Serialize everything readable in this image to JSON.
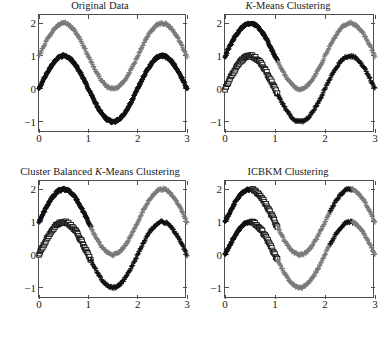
{
  "figure": {
    "width": 384,
    "height": 337,
    "background": "#ffffff",
    "layout": "2x2 grid of clustering scatter plots"
  },
  "colors": {
    "cluster_dark": "#111111",
    "cluster_gray": "#7a7a7a",
    "axis": "#4d4d4d",
    "text": "#1a1a1a"
  },
  "axes_common": {
    "xlim": [
      0,
      3
    ],
    "ylim": [
      -1.35,
      2.25
    ],
    "xticks": [
      0,
      1,
      2,
      3
    ],
    "xtick_labels": [
      "0",
      "1",
      "2",
      "3"
    ],
    "yticks": [
      -1,
      0,
      1,
      2
    ],
    "ytick_labels": [
      "−1",
      "0",
      "1",
      "2"
    ],
    "grid": false,
    "xlabel": "",
    "ylabel": ""
  },
  "curves": {
    "upper": {
      "description": "sine curve, amplitude 1, offset 1, period 2",
      "amplitude": 1.0,
      "offset": 1.0,
      "period": 2.0,
      "phase": 0.0,
      "n_points": 120,
      "noise": 0.035
    },
    "lower": {
      "description": "sine curve, amplitude 1, offset 0, period 2",
      "amplitude": 1.0,
      "offset": 0.0,
      "period": 2.0,
      "phase": 0.0,
      "n_points": 120,
      "noise": 0.035
    }
  },
  "panels": [
    {
      "id": "original-data",
      "title_parts": [
        {
          "text": "Original Data",
          "italic": false
        }
      ],
      "title_plain": "Original Data",
      "series": [
        {
          "name": "upper-curve",
          "curve": "upper",
          "marker": "plus",
          "color": "#7a7a7a",
          "x_from": 0.0,
          "x_to": 3.0
        },
        {
          "name": "lower-curve",
          "curve": "lower",
          "marker": "diamond",
          "color": "#111111",
          "x_from": 0.0,
          "x_to": 3.0
        }
      ]
    },
    {
      "id": "k-means-clustering",
      "title_parts": [
        {
          "text": "K",
          "italic": true
        },
        {
          "text": "-Means Clustering",
          "italic": false
        }
      ],
      "title_plain": "K-Means Clustering",
      "series": [
        {
          "name": "upper-left-dark-diamonds",
          "curve": "upper",
          "marker": "diamond",
          "color": "#111111",
          "x_from": 0.0,
          "x_to": 1.05
        },
        {
          "name": "upper-right-gray-plus",
          "curve": "upper",
          "marker": "plus",
          "color": "#7a7a7a",
          "x_from": 1.05,
          "x_to": 3.0
        },
        {
          "name": "lower-left-open-squares",
          "curve": "lower",
          "marker": "square",
          "color": "#111111",
          "x_from": 0.0,
          "x_to": 1.05
        },
        {
          "name": "lower-right-dark-plus",
          "curve": "lower",
          "marker": "plus",
          "color": "#111111",
          "x_from": 1.05,
          "x_to": 3.0
        }
      ]
    },
    {
      "id": "cluster-balanced-k-means-clustering",
      "title_parts": [
        {
          "text": "Cluster Balanced ",
          "italic": false
        },
        {
          "text": "K",
          "italic": true
        },
        {
          "text": "-Means Clustering",
          "italic": false
        }
      ],
      "title_plain": "Cluster Balanced K-Means Clustering",
      "series": [
        {
          "name": "upper-left-dark-diamonds",
          "curve": "upper",
          "marker": "diamond",
          "color": "#111111",
          "x_from": 0.0,
          "x_to": 1.05
        },
        {
          "name": "upper-right-gray-plus",
          "curve": "upper",
          "marker": "plus",
          "color": "#7a7a7a",
          "x_from": 1.05,
          "x_to": 3.0
        },
        {
          "name": "lower-left-open-squares",
          "curve": "lower",
          "marker": "square",
          "color": "#111111",
          "x_from": 0.0,
          "x_to": 1.05
        },
        {
          "name": "lower-right-dark-plus",
          "curve": "lower",
          "marker": "plus",
          "color": "#111111",
          "x_from": 1.05,
          "x_to": 3.0
        }
      ]
    },
    {
      "id": "icbkm-clustering",
      "title_parts": [
        {
          "text": "ICBKM Clustering",
          "italic": false
        }
      ],
      "title_plain": "ICBKM Clustering",
      "series": [
        {
          "name": "upper-left-dark-diamonds",
          "curve": "upper",
          "marker": "diamond",
          "color": "#111111",
          "x_from": 0.0,
          "x_to": 0.55
        },
        {
          "name": "upper-mid-open-squares",
          "curve": "upper",
          "marker": "square",
          "color": "#111111",
          "x_from": 0.55,
          "x_to": 1.05
        },
        {
          "name": "upper-right-gray-plus",
          "curve": "upper",
          "marker": "plus",
          "color": "#7a7a7a",
          "x_from": 1.05,
          "x_to": 2.1
        },
        {
          "name": "upper-far-right-dark-plus",
          "curve": "upper",
          "marker": "plus",
          "color": "#111111",
          "x_from": 2.1,
          "x_to": 2.55
        },
        {
          "name": "upper-tail-gray-plus",
          "curve": "upper",
          "marker": "plus",
          "color": "#7a7a7a",
          "x_from": 2.55,
          "x_to": 3.0
        },
        {
          "name": "lower-left-dark-diamonds",
          "curve": "lower",
          "marker": "diamond",
          "color": "#111111",
          "x_from": 0.0,
          "x_to": 0.55
        },
        {
          "name": "lower-mid-open-squares",
          "curve": "lower",
          "marker": "square",
          "color": "#111111",
          "x_from": 0.55,
          "x_to": 1.05
        },
        {
          "name": "lower-right-gray-plus",
          "curve": "lower",
          "marker": "plus",
          "color": "#7a7a7a",
          "x_from": 1.05,
          "x_to": 2.1
        },
        {
          "name": "lower-far-right-dark-plus",
          "curve": "lower",
          "marker": "plus",
          "color": "#111111",
          "x_from": 2.1,
          "x_to": 2.55
        },
        {
          "name": "lower-tail-gray-plus",
          "curve": "lower",
          "marker": "plus",
          "color": "#7a7a7a",
          "x_from": 2.55,
          "x_to": 3.0
        }
      ]
    }
  ],
  "chart_data": {
    "type": "scatter",
    "xlabel": "",
    "ylabel": "",
    "xlim": [
      0,
      3
    ],
    "ylim": [
      -1.35,
      2.25
    ],
    "xticks": [
      0,
      1,
      2,
      3
    ],
    "yticks": [
      -1,
      0,
      1,
      2
    ],
    "grid": false,
    "legend": "none",
    "subplot_titles": [
      "Original Data",
      "K-Means Clustering",
      "Cluster Balanced K-Means Clustering",
      "ICBKM Clustering"
    ],
    "x": [
      0.0,
      0.025,
      0.05,
      0.076,
      0.101,
      0.126,
      0.151,
      0.176,
      0.202,
      0.227,
      0.252,
      0.277,
      0.303,
      0.328,
      0.353,
      0.378,
      0.403,
      0.429,
      0.454,
      0.479,
      0.504,
      0.529,
      0.555,
      0.58,
      0.605,
      0.63,
      0.655,
      0.681,
      0.706,
      0.731,
      0.756,
      0.782,
      0.807,
      0.832,
      0.857,
      0.882,
      0.908,
      0.933,
      0.958,
      0.983,
      1.008,
      1.034,
      1.059,
      1.084,
      1.109,
      1.134,
      1.16,
      1.185,
      1.21,
      1.235,
      1.261,
      1.286,
      1.311,
      1.336,
      1.361,
      1.387,
      1.412,
      1.437,
      1.462,
      1.487,
      1.513,
      1.538,
      1.563,
      1.588,
      1.613,
      1.639,
      1.664,
      1.689,
      1.714,
      1.74,
      1.765,
      1.79,
      1.815,
      1.84,
      1.866,
      1.891,
      1.916,
      1.941,
      1.966,
      1.992,
      2.017,
      2.042,
      2.067,
      2.092,
      2.118,
      2.143,
      2.168,
      2.193,
      2.218,
      2.244,
      2.269,
      2.294,
      2.319,
      2.345,
      2.37,
      2.395,
      2.42,
      2.445,
      2.471,
      2.496,
      2.521,
      2.546,
      2.571,
      2.597,
      2.622,
      2.647,
      2.672,
      2.697,
      2.723,
      2.748,
      2.773,
      2.798,
      2.824,
      2.849,
      2.874,
      2.899,
      2.924,
      2.95,
      2.975,
      3.0
    ],
    "series": [
      {
        "name": "upper cluster (y = 1 + sin(pi x))",
        "formula": "y = 1 + sin(pi * x)",
        "values": [
          1.0,
          1.079,
          1.158,
          1.237,
          1.314,
          1.391,
          1.466,
          1.54,
          1.611,
          1.68,
          1.746,
          1.809,
          1.869,
          1.925,
          1.976,
          2.024,
          2.067,
          2.105,
          2.139,
          2.167,
          2.19,
          2.208,
          2.22,
          2.227,
          2.228,
          2.223,
          2.213,
          2.198,
          2.177,
          2.15,
          2.119,
          2.083,
          2.042,
          1.997,
          1.948,
          1.895,
          1.839,
          1.78,
          1.718,
          1.653,
          1.587,
          1.519,
          1.45,
          1.38,
          1.31,
          1.239,
          1.169,
          1.1,
          1.031,
          0.964,
          0.899,
          0.836,
          0.775,
          0.717,
          0.662,
          0.61,
          0.561,
          0.517,
          0.476,
          0.44,
          0.408,
          0.381,
          0.358,
          0.341,
          0.328,
          0.321,
          0.319,
          0.322,
          0.33,
          0.344,
          0.362,
          0.386,
          0.414,
          0.447,
          0.485,
          0.527,
          0.574,
          0.624,
          0.678,
          0.736,
          0.797,
          0.86,
          0.926,
          0.995,
          1.065,
          1.136,
          1.208,
          1.281,
          1.353,
          1.425,
          1.496,
          1.566,
          1.633,
          1.699,
          1.761,
          1.821,
          1.877,
          1.929,
          1.977,
          2.02,
          2.058,
          2.091,
          2.118,
          2.14,
          2.155,
          2.165,
          2.168,
          2.165,
          2.156,
          2.14,
          2.119,
          2.092,
          2.058,
          2.02,
          1.976,
          1.928,
          1.875,
          1.818,
          1.757,
          1.693
        ],
        "marker_original": "plus",
        "color_original": "#7a7a7a"
      },
      {
        "name": "lower cluster (y = sin(pi x))",
        "formula": "y = sin(pi * x)",
        "values": [
          0.0,
          0.079,
          0.158,
          0.237,
          0.314,
          0.391,
          0.466,
          0.54,
          0.611,
          0.68,
          0.746,
          0.809,
          0.869,
          0.925,
          0.976,
          1.024,
          1.067,
          1.105,
          1.139,
          1.167,
          1.19,
          1.208,
          1.22,
          1.227,
          1.228,
          1.223,
          1.213,
          1.198,
          1.177,
          1.15,
          1.119,
          1.083,
          1.042,
          0.997,
          0.948,
          0.895,
          0.839,
          0.78,
          0.718,
          0.653,
          0.587,
          0.519,
          0.45,
          0.38,
          0.31,
          0.239,
          0.169,
          0.1,
          0.031,
          -0.036,
          -0.101,
          -0.164,
          -0.225,
          -0.283,
          -0.338,
          -0.39,
          -0.439,
          -0.483,
          -0.524,
          -0.56,
          -0.592,
          -0.619,
          -0.642,
          -0.659,
          -0.672,
          -0.679,
          -0.681,
          -0.678,
          -0.67,
          -0.656,
          -0.638,
          -0.614,
          -0.586,
          -0.553,
          -0.515,
          -0.473,
          -0.426,
          -0.376,
          -0.322,
          -0.264,
          -0.203,
          -0.14,
          -0.074,
          -0.005,
          0.065,
          0.136,
          0.208,
          0.281,
          0.353,
          0.425,
          0.496,
          0.566,
          0.633,
          0.699,
          0.761,
          0.821,
          0.877,
          0.929,
          0.977,
          1.02,
          1.058,
          1.091,
          1.118,
          1.14,
          1.155,
          1.165,
          1.168,
          1.165,
          1.156,
          1.14,
          1.119,
          1.092,
          1.058,
          1.02,
          0.976,
          0.928,
          0.875,
          0.818,
          0.757,
          0.693
        ],
        "marker_original": "diamond",
        "color_original": "#111111"
      }
    ]
  }
}
